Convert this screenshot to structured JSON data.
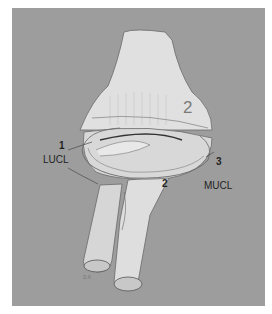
{
  "figure": {
    "background_color": "#9d9d9d",
    "bone_color": "#dcdcdc",
    "outline_color": "#6a6a6a",
    "labels": {
      "num_1": "1",
      "lucl": "LUCL",
      "num_2_top": "2",
      "num_2_ring": "2",
      "num_3": "3",
      "mucl": "MUCL"
    }
  }
}
